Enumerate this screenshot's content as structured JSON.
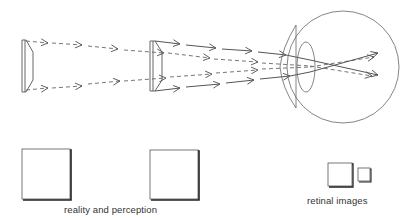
{
  "diagram": {
    "type": "optics-perception-illustration",
    "labels": {
      "reality_and_perception": "reality and perception",
      "retinal_images": "retinal images"
    },
    "elements": {
      "objects": [
        "near-object-left",
        "far-object-middle"
      ],
      "eye": {
        "parts": [
          "eyeball",
          "cornea",
          "lens"
        ]
      },
      "squares": {
        "reality": [
          "square-left",
          "square-middle"
        ],
        "retinal": [
          "retinal-image-large",
          "retinal-image-small"
        ]
      },
      "rays": {
        "dashed": "rays from first object",
        "solid": "rays from second object"
      }
    },
    "colors": {
      "stroke": "#555555",
      "text": "#333333",
      "background": "#ffffff"
    }
  }
}
